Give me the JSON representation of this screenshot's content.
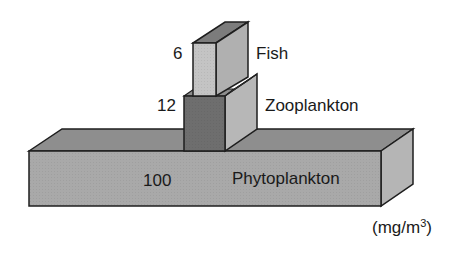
{
  "diagram": {
    "unit_prefix": "(mg/m",
    "unit_exponent": "3",
    "unit_suffix": ")",
    "levels": [
      {
        "name": "Phytoplankton",
        "value": "100",
        "front_color": "#a9a9a9",
        "top_color": "#8e8e8e",
        "side_color": "#b5b5b5"
      },
      {
        "name": "Zooplankton",
        "value": "12",
        "front_color": "#6e6e6e",
        "top_color": "#8c8c8c",
        "side_color": "#b7b7b7"
      },
      {
        "name": "Fish",
        "value": "6",
        "front_color": "#c4c4c4",
        "top_color": "#7c7c7c",
        "side_color": "#b0b0b0"
      }
    ],
    "stroke_color": "#1e1e1e"
  }
}
